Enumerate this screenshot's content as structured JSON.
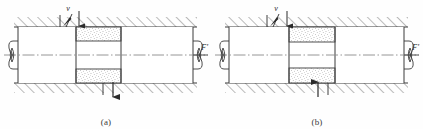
{
  "figure": {
    "title": "",
    "background_color": "#fefefe",
    "line_color": "#3b3b3b",
    "hatch_color": "#555555",
    "stipple_color": "#666666"
  },
  "panels": [
    {
      "id": "a",
      "caption": "(a)",
      "labels": {
        "velocity": "v",
        "force": "F'"
      },
      "annotations": {
        "top_arrow_direction": "down",
        "bottom_arrow_direction": "down",
        "velocity_arrow_direction": "down-right",
        "centerline_style": "dash-dot",
        "left_end": "break-symbol",
        "right_end": "break-symbol",
        "lining_position": "right-of-center",
        "housing_fill": "diagonal-hatch",
        "lining_fill": "stipple"
      }
    },
    {
      "id": "b",
      "caption": "(b)",
      "labels": {
        "velocity": "v",
        "force": "F'"
      },
      "annotations": {
        "top_arrow_direction": "down",
        "bottom_arrow_direction": "up",
        "velocity_arrow_direction": "down-right",
        "centerline_style": "dash-dot",
        "left_end": "break-symbol",
        "right_end": "break-symbol",
        "lining_position": "right-of-center",
        "housing_fill": "diagonal-hatch",
        "lining_fill": "stipple"
      }
    }
  ]
}
